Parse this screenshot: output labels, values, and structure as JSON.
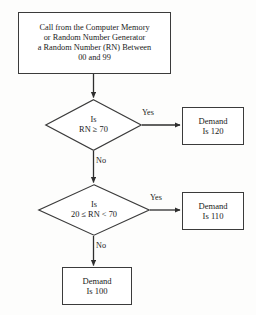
{
  "diagram": {
    "type": "flowchart",
    "title_text": "Random Number Demand Simulation Flowchart",
    "background_color": "#fdfdfc",
    "line_color": "#2e2e2e",
    "nodes": {
      "start": {
        "shape": "rectangle",
        "lines": [
          "Call from the Computer Memory",
          "or Random Number Generator",
          "a Random Number (RN) Between",
          "00 and 99"
        ]
      },
      "decision_1": {
        "shape": "diamond",
        "line_1": "Is",
        "line_2": "RN ≥ 70"
      },
      "decision_2": {
        "shape": "diamond",
        "line_1": "Is",
        "line_2": "20 ≤ RN < 70"
      },
      "demand_120": {
        "shape": "rectangle",
        "line_1": "Demand",
        "line_2": "Is 120"
      },
      "demand_110": {
        "shape": "rectangle",
        "line_1": "Demand",
        "line_2": "Is 110"
      },
      "demand_100": {
        "shape": "rectangle",
        "line_1": "Demand",
        "line_2": "Is 100"
      }
    },
    "edge_labels": {
      "yes_1": "Yes",
      "yes_2": "Yes",
      "no_1": "No",
      "no_2": "No"
    }
  }
}
